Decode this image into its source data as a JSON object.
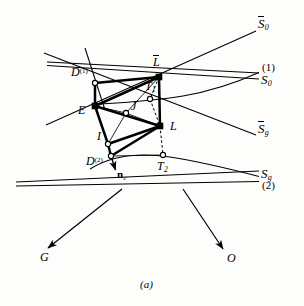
{
  "figure": {
    "caption": "(a)",
    "background_color": "#fdfdfb",
    "ink_color": "#000000"
  },
  "labels": {
    "s0_bar": {
      "base": "S",
      "overline": true,
      "sub": "0",
      "x": 258,
      "y": 22
    },
    "branch_1": {
      "text": "(1)",
      "x": 262,
      "y": 68
    },
    "s0": {
      "base": "S",
      "overline": false,
      "sub": "0",
      "x": 261,
      "y": 78
    },
    "sg_bar": {
      "base": "S",
      "overline": true,
      "sub": "g",
      "x": 258,
      "y": 127
    },
    "sg": {
      "base": "S",
      "overline": false,
      "sub": "g",
      "x": 261,
      "y": 172
    },
    "branch_2": {
      "text": "(2)",
      "x": 262,
      "y": 183
    },
    "d1": {
      "base": "D",
      "sup": "(1)",
      "x": 74,
      "y": 72
    },
    "e": {
      "base": "E",
      "x": 79,
      "y": 110
    },
    "i": {
      "base": "I",
      "x": 96,
      "y": 136
    },
    "d2": {
      "base": "D",
      "sup": "(2)",
      "x": 88,
      "y": 160
    },
    "j": {
      "base": "J",
      "x": 132,
      "y": 104
    },
    "l_bar": {
      "base": "L",
      "overline": true,
      "x": 153,
      "y": 60
    },
    "t1": {
      "base": "T",
      "sub": "1",
      "x": 146,
      "y": 84
    },
    "l": {
      "base": "L",
      "x": 171,
      "y": 124
    },
    "t2": {
      "base": "T",
      "sub": "2",
      "x": 158,
      "y": 164
    },
    "n_c": {
      "base": "n",
      "sub": "c",
      "bold": true,
      "x": 117,
      "y": 174
    },
    "g": {
      "base": "G",
      "x": 41,
      "y": 256
    },
    "o": {
      "base": "O",
      "x": 228,
      "y": 257
    }
  },
  "vertices": {
    "D1": {
      "name": "D-superscript-1",
      "x": 95,
      "y": 83,
      "marker": "open"
    },
    "E": {
      "name": "E",
      "x": 95,
      "y": 106,
      "marker": "filled"
    },
    "I": {
      "name": "I",
      "x": 108,
      "y": 144,
      "marker": "open"
    },
    "D2": {
      "name": "D-superscript-2",
      "x": 111,
      "y": 156,
      "marker": "open"
    },
    "J": {
      "name": "J",
      "x": 126,
      "y": 113,
      "marker": "open"
    },
    "Lbar": {
      "name": "L-bar",
      "x": 159,
      "y": 77,
      "marker": "filled"
    },
    "T1": {
      "name": "T-subscript-1",
      "x": 150,
      "y": 99,
      "marker": "open"
    },
    "L": {
      "name": "L",
      "x": 160,
      "y": 126,
      "marker": "filled"
    },
    "T2": {
      "name": "T-subscript-2",
      "x": 163,
      "y": 155,
      "marker": "open"
    }
  },
  "arrows": {
    "nc": {
      "name": "normal-vector-nc",
      "from_x": 111,
      "from_y": 156,
      "to_x": 116,
      "to_y": 172
    },
    "to_G": {
      "name": "direction-to-G",
      "from_x": 122,
      "from_y": 189,
      "to_x": 47,
      "to_y": 249
    },
    "to_O": {
      "name": "direction-to-O",
      "from_x": 183,
      "from_y": 189,
      "to_x": 224,
      "to_y": 250
    }
  },
  "straight_lines": [
    {
      "name": "line-s0-bar",
      "x1": 46,
      "y1": 125,
      "x2": 256,
      "y2": 31
    },
    {
      "name": "line-sg-bar",
      "x1": 44,
      "y1": 53,
      "x2": 256,
      "y2": 135
    },
    {
      "name": "line-s0-upper",
      "x1": 47,
      "y1": 62,
      "x2": 259,
      "y2": 73
    },
    {
      "name": "line-s0-lower",
      "x1": 47,
      "y1": 65,
      "x2": 259,
      "y2": 79
    },
    {
      "name": "line-sg-upper",
      "x1": 16,
      "y1": 183,
      "x2": 259,
      "y2": 171
    },
    {
      "name": "line-sg-lower",
      "x1": 16,
      "y1": 186,
      "x2": 259,
      "y2": 181
    },
    {
      "name": "line-d1-tangent",
      "x1": 85,
      "y1": 48,
      "x2": 104,
      "y2": 108
    }
  ],
  "curves": [
    {
      "name": "curve-s0-branch-1",
      "path": "M 100,104 C 128,102 156,100 183,96 C 212,91 240,82 259,73"
    },
    {
      "name": "curve-sg-branch-2",
      "path": "M 90,169 C 112,155 140,153 170,157 C 202,162 236,170 259,176"
    }
  ],
  "solid_edges": [
    {
      "name": "edge-D1-E",
      "x1": 95,
      "y1": 83,
      "x2": 95,
      "y2": 106
    },
    {
      "name": "edge-D1-Lbar",
      "x1": 95,
      "y1": 83,
      "x2": 159,
      "y2": 77
    },
    {
      "name": "edge-E-Lbar",
      "x1": 95,
      "y1": 106,
      "x2": 159,
      "y2": 77
    },
    {
      "name": "edge-E-I",
      "x1": 95,
      "y1": 106,
      "x2": 108,
      "y2": 144
    },
    {
      "name": "edge-I-D2",
      "x1": 108,
      "y1": 144,
      "x2": 111,
      "y2": 156
    },
    {
      "name": "edge-Lbar-L",
      "x1": 159,
      "y1": 77,
      "x2": 160,
      "y2": 126
    },
    {
      "name": "edge-L-D2",
      "x1": 160,
      "y1": 126,
      "x2": 111,
      "y2": 156
    },
    {
      "name": "edge-I-L",
      "x1": 108,
      "y1": 144,
      "x2": 160,
      "y2": 126
    },
    {
      "name": "edge-E-L",
      "x1": 95,
      "y1": 106,
      "x2": 160,
      "y2": 126
    }
  ],
  "thin_edges": [
    {
      "name": "thin-E-J",
      "x1": 95,
      "y1": 106,
      "x2": 126,
      "y2": 113
    },
    {
      "name": "thin-J-Lbar",
      "x1": 126,
      "y1": 113,
      "x2": 159,
      "y2": 77
    },
    {
      "name": "thin-J-L",
      "x1": 126,
      "y1": 113,
      "x2": 160,
      "y2": 126
    },
    {
      "name": "thin-J-I",
      "x1": 126,
      "y1": 113,
      "x2": 108,
      "y2": 144
    },
    {
      "name": "thin-I-D2",
      "x1": 108,
      "y1": 144,
      "x2": 111,
      "y2": 156
    },
    {
      "name": "thin-T2-D2",
      "x1": 163,
      "y1": 155,
      "x2": 111,
      "y2": 156
    },
    {
      "name": "thin-T1-left",
      "x1": 150,
      "y1": 99,
      "x2": 100,
      "y2": 104
    }
  ],
  "dashed_edges": [
    {
      "name": "dashed-Lbar-T1-L",
      "x1": 159,
      "y1": 77,
      "x2": 150,
      "y2": 99,
      "x3": 160,
      "y2b": 126
    },
    {
      "name": "dashed-L-T2",
      "x1": 160,
      "y1": 126,
      "x2": 163,
      "y2": 155
    }
  ]
}
